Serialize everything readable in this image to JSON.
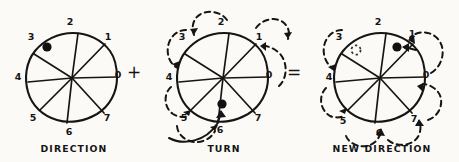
{
  "figure": {
    "background_color": "#fbfaf7",
    "ink_color": "#151515"
  },
  "operators": {
    "plus": "+",
    "equals": "="
  },
  "sector_labels": [
    "0",
    "1",
    "2",
    "3",
    "4",
    "5",
    "6",
    "7"
  ],
  "panels": [
    {
      "id": "direction",
      "caption": "DIRECTION",
      "center_x": 72,
      "center_y": 78,
      "radius": 45,
      "sectors": 8,
      "marker_sector": "3",
      "marker_style": "filled-dot",
      "arrows": "none"
    },
    {
      "id": "turn",
      "caption": "TURN",
      "center_x": 223,
      "center_y": 78,
      "radius": 45,
      "sectors": 8,
      "marker_sector": "6",
      "marker_style": "filled-dot-with-pointer",
      "arrows": "dashed-counterclockwise-0-to-5"
    },
    {
      "id": "new-direction",
      "caption": "NEW DIRECTION",
      "center_x": 380,
      "center_y": 78,
      "radius": 45,
      "sectors": 8,
      "marker_sector": "1",
      "marker_style": "filled-dot-with-pointer",
      "ghost_sector": "3",
      "ghost_style": "dotted-open-circle",
      "arrows": "dashed-counterclockwise-7-to-3-and-0-to-1"
    }
  ]
}
